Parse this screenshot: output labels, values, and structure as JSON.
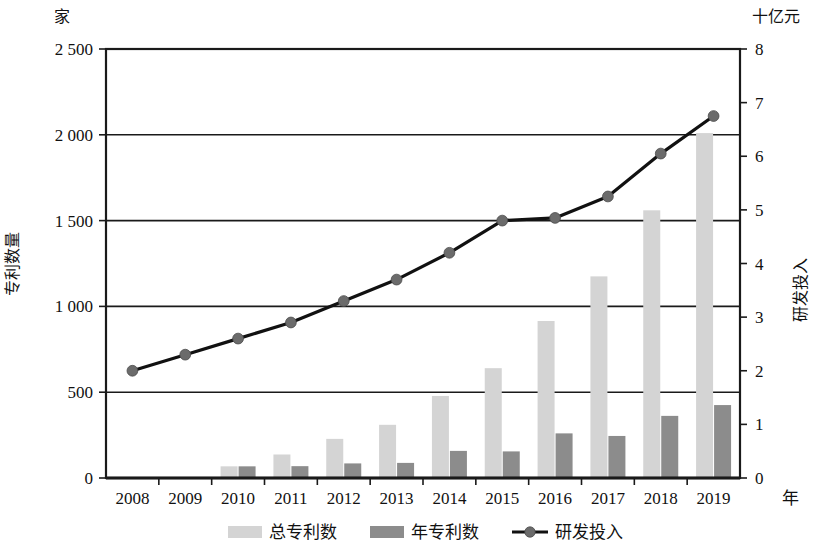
{
  "chart_data": {
    "type": "bar",
    "title": "",
    "categories": [
      "2008",
      "2009",
      "2010",
      "2011",
      "2012",
      "2013",
      "2014",
      "2015",
      "2016",
      "2017",
      "2018",
      "2019"
    ],
    "xlabel": "年",
    "ylabel": "专利数量",
    "y_unit": "家",
    "ylim": [
      0,
      2500
    ],
    "y_ticks": [
      "0",
      "500",
      "1 000",
      "1 500",
      "2 000",
      "2 500"
    ],
    "y_tick_values": [
      0,
      500,
      1000,
      1500,
      2000,
      2500
    ],
    "y2label": "研发投入",
    "y2_unit": "十亿元",
    "y2lim": [
      0,
      8
    ],
    "y2_ticks": [
      "0",
      "1",
      "2",
      "3",
      "4",
      "5",
      "6",
      "7",
      "8"
    ],
    "y2_tick_values": [
      0,
      1,
      2,
      3,
      4,
      5,
      6,
      7,
      8
    ],
    "grid": true,
    "legend_position": "bottom",
    "series": [
      {
        "name": "总专利数",
        "type": "bar",
        "axis": "left",
        "color": "#d4d4d4",
        "values": [
          0,
          0,
          68,
          137,
          228,
          310,
          478,
          640,
          915,
          1175,
          1560,
          2010
        ]
      },
      {
        "name": "年专利数",
        "type": "bar",
        "axis": "left",
        "color": "#8c8c8c",
        "values": [
          0,
          0,
          68,
          69,
          85,
          88,
          158,
          155,
          260,
          245,
          362,
          425
        ]
      },
      {
        "name": "研发投入",
        "type": "line",
        "axis": "right",
        "color": "#111111",
        "marker_color": "#6b6b6b",
        "values": [
          2.0,
          2.3,
          2.6,
          2.9,
          3.3,
          3.7,
          4.2,
          4.8,
          4.85,
          5.25,
          6.05,
          6.75
        ]
      }
    ]
  },
  "legend": {
    "items": [
      {
        "label": "总专利数",
        "kind": "swatch",
        "color": "#d4d4d4"
      },
      {
        "label": "年专利数",
        "kind": "swatch",
        "color": "#8c8c8c"
      },
      {
        "label": "研发投入",
        "kind": "line",
        "color": "#111111"
      }
    ]
  },
  "axes": {
    "left_unit": "家",
    "left_title": "专利数量",
    "right_unit": "十亿元",
    "right_title": "研发投入",
    "x_unit": "年"
  }
}
